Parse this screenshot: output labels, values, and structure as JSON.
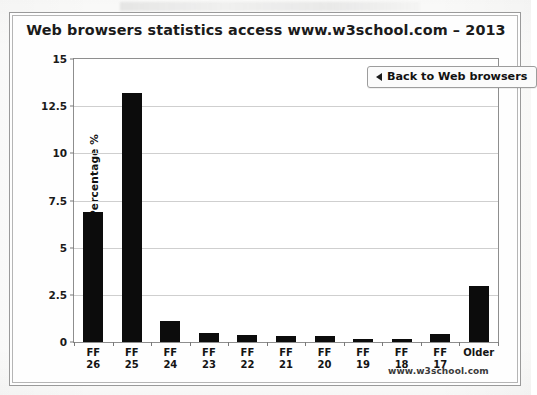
{
  "chart_data": {
    "type": "bar",
    "title": "Web browsers statistics access www.w3school.com – 2013",
    "xlabel": "",
    "ylabel": "Percentage %",
    "ylim": [
      0,
      15
    ],
    "yticks": [
      "0",
      "2.5",
      "5",
      "7.5",
      "10",
      "12.5",
      "15"
    ],
    "ytick_values": [
      0,
      2.5,
      5,
      7.5,
      10,
      12.5,
      15
    ],
    "grid": true,
    "legend": "none",
    "bar_color": "#0c0c0c",
    "categories": [
      "FF 26",
      "FF 25",
      "FF 24",
      "FF 23",
      "FF 22",
      "FF 21",
      "FF 20",
      "FF 19",
      "FF 18",
      "FF 17",
      "Older"
    ],
    "category_lines": [
      {
        "line1": "FF",
        "line2": "26"
      },
      {
        "line1": "FF",
        "line2": "25"
      },
      {
        "line1": "FF",
        "line2": "24"
      },
      {
        "line1": "FF",
        "line2": "23"
      },
      {
        "line1": "FF",
        "line2": "22"
      },
      {
        "line1": "FF",
        "line2": "21"
      },
      {
        "line1": "FF",
        "line2": "20"
      },
      {
        "line1": "FF",
        "line2": "19"
      },
      {
        "line1": "FF",
        "line2": "18"
      },
      {
        "line1": "FF",
        "line2": "17"
      },
      {
        "line1": "Older",
        "line2": ""
      }
    ],
    "values": [
      6.9,
      13.2,
      1.1,
      0.5,
      0.35,
      0.3,
      0.3,
      0.15,
      0.15,
      0.4,
      2.95
    ]
  },
  "controls": {
    "back_button_label": "Back to Web browsers",
    "back_button_icon": "triangle-left-icon"
  },
  "footer": {
    "watermark": "www.w3school.com"
  }
}
